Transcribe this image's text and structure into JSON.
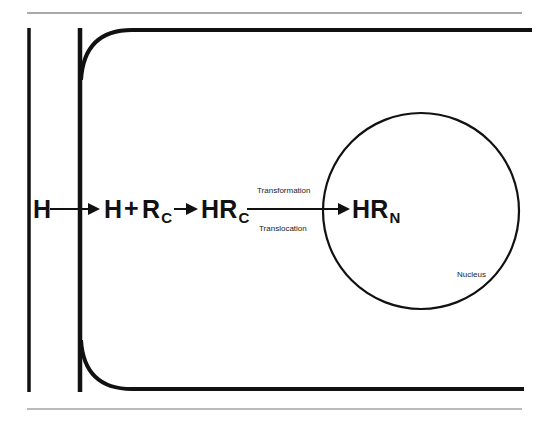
{
  "diagram": {
    "type": "cell-hormone-receptor-pathway",
    "colors": {
      "line": "#111111",
      "rule": "#555555",
      "background": "#ffffff"
    },
    "labels": {
      "hormone_outside": "H",
      "hormone_inside": "H",
      "plus": "+",
      "receptor_base": "R",
      "receptor_sub": "C",
      "complex_cyto_base": "HR",
      "complex_cyto_sub": "C",
      "complex_nuc_base": "HR",
      "complex_nuc_sub": "N",
      "step_above": "Transformation",
      "step_below": "Translocation",
      "nucleus": "Nucleus"
    },
    "structures": [
      {
        "name": "outer-boundary-line"
      },
      {
        "name": "cell-membrane"
      },
      {
        "name": "nucleus-circle"
      }
    ],
    "arrows": [
      {
        "from": "H",
        "to": "H + Rc"
      },
      {
        "from": "H + Rc",
        "to": "HRc"
      },
      {
        "from": "HRc",
        "to": "HRn"
      }
    ]
  }
}
